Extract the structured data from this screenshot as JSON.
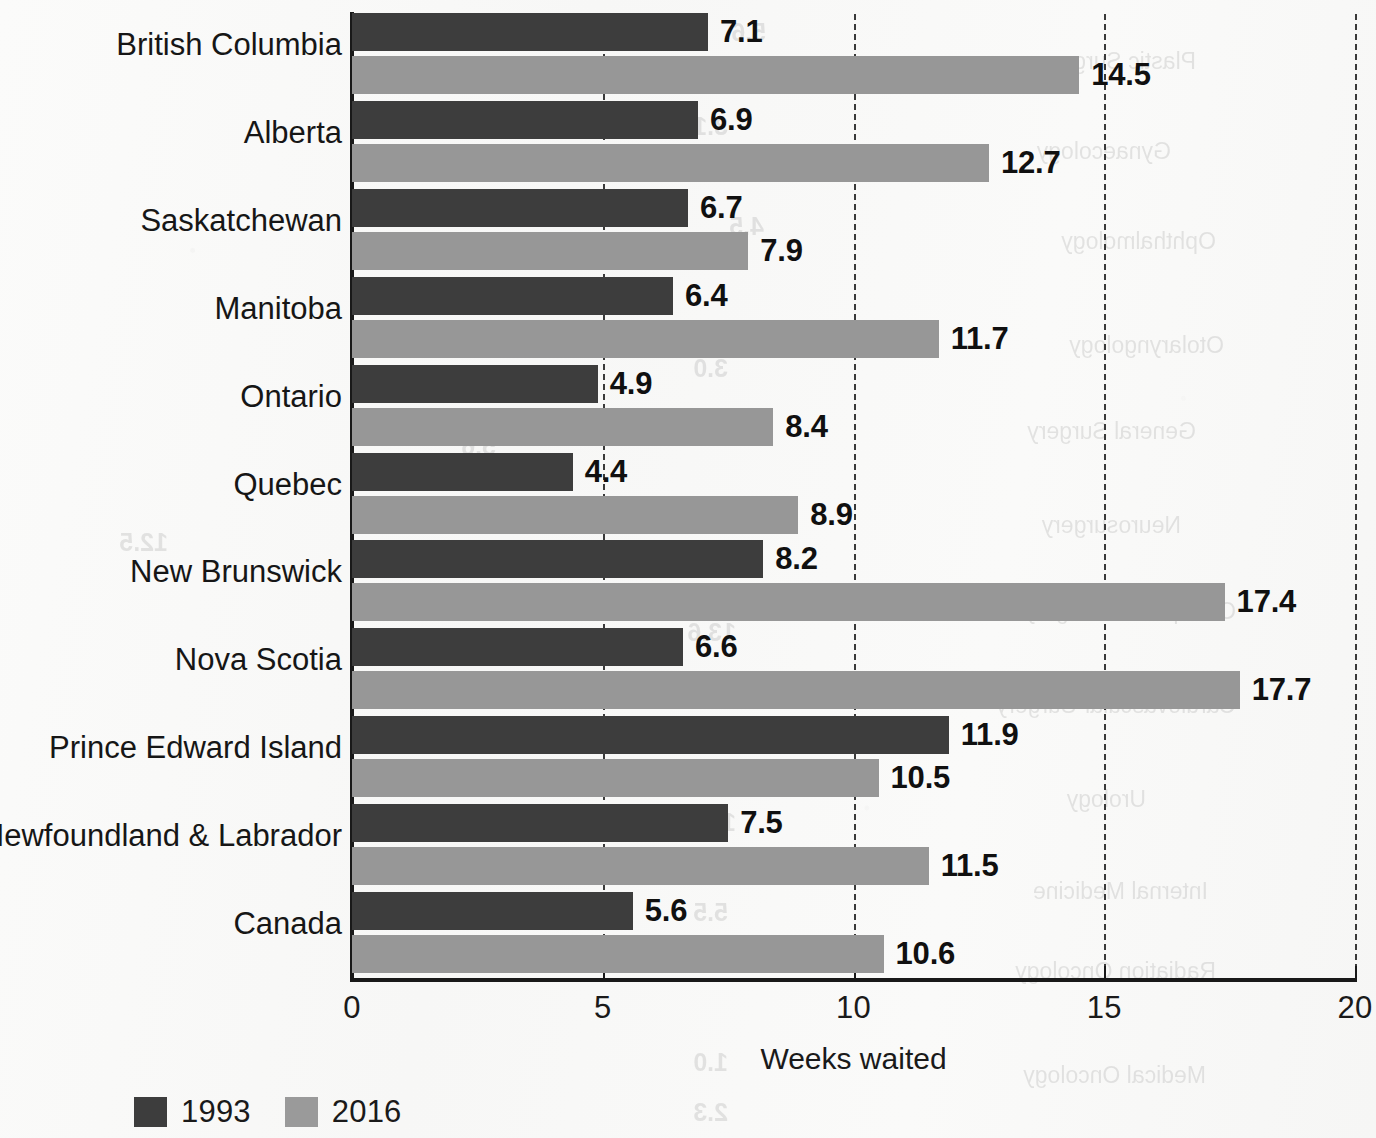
{
  "chart_data": {
    "type": "bar",
    "orientation": "horizontal",
    "title": "",
    "xlabel": "Weeks waited",
    "ylabel": "",
    "xlim": [
      0,
      20
    ],
    "xticks": [
      0,
      5,
      10,
      15,
      20
    ],
    "xtick_labels": [
      "0",
      "5",
      "10",
      "15",
      "20"
    ],
    "grid": "vertical dashed gridlines at 5, 10, 15, 20",
    "legend_position": "bottom-left",
    "categories": [
      "British Columbia",
      "Alberta",
      "Saskatchewan",
      "Manitoba",
      "Ontario",
      "Quebec",
      "New Brunswick",
      "Nova Scotia",
      "Prince Edward Island",
      "Newfoundland & Labrador",
      "Canada"
    ],
    "series": [
      {
        "name": "1993",
        "color": "#3d3d3d",
        "values": [
          7.1,
          6.9,
          6.7,
          6.4,
          4.9,
          4.4,
          8.2,
          6.6,
          11.9,
          7.5,
          5.6
        ],
        "labels": [
          "7.1",
          "6.9",
          "6.7",
          "6.4",
          "4.9",
          "4.4",
          "8.2",
          "6.6",
          "11.9",
          "7.5",
          "5.6"
        ]
      },
      {
        "name": "2016",
        "color": "#979797",
        "values": [
          14.5,
          12.7,
          7.9,
          11.7,
          8.4,
          8.9,
          17.4,
          17.7,
          10.5,
          11.5,
          10.6
        ],
        "labels": [
          "14.5",
          "12.7",
          "7.9",
          "11.7",
          "8.4",
          "8.9",
          "17.4",
          "17.7",
          "10.5",
          "11.5",
          "10.6"
        ]
      }
    ]
  },
  "legend": {
    "items": [
      {
        "label": "1993",
        "color": "#3d3d3d"
      },
      {
        "label": "2016",
        "color": "#9a9a9a"
      }
    ]
  },
  "axis": {
    "x_label": "Weeks waited",
    "tick_labels": [
      "0",
      "5",
      "10",
      "15",
      "20"
    ]
  },
  "ghost_text": {
    "note": "faint mirrored bleed-through from the reverse side of the printed page",
    "labels": [
      "Plastic Surgery",
      "Gynaecology",
      "Ophthalmology",
      "Otolaryngology",
      "General Surgery",
      "Neurosurgery",
      "Orthopaedic Surgery",
      "Cardiovascular Surgery",
      "Urology",
      "Internal Medicine",
      "Radiation Oncology",
      "Medical Oncology"
    ],
    "numbers": [
      "5.6",
      "3.1",
      "4.5",
      "2.0",
      "2.0",
      "5.6",
      "12.5",
      "13.6",
      "5.6",
      "10.8",
      "5.5",
      "3.8",
      "1.0",
      "2.3"
    ]
  }
}
